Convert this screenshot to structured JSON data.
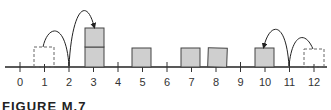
{
  "diagram": {
    "type": "number-line",
    "axis": {
      "min": 0,
      "max": 12,
      "tick_labels": [
        "0",
        "1",
        "2",
        "3",
        "4",
        "5",
        "6",
        "7",
        "8",
        "9",
        "10",
        "11",
        "12"
      ]
    },
    "solid_blocks": [
      {
        "position": 3,
        "stack": 2
      },
      {
        "position": 5,
        "stack": 1
      },
      {
        "position": 7,
        "stack": 1
      },
      {
        "position": 8,
        "stack": 1
      },
      {
        "position": 10,
        "stack": 1
      }
    ],
    "dashed_blocks": [
      {
        "position": 1
      },
      {
        "position": 12
      }
    ],
    "arrows": [
      {
        "from": 1,
        "via": 2,
        "to": 3,
        "description": "block hops from 1 over 2 onto stack at 3"
      },
      {
        "from": 12,
        "via": 11,
        "to": 10,
        "description": "block hops from 12 over 11 onto 10"
      }
    ],
    "colors": {
      "block_fill": "#cfcfcf",
      "stroke": "#333333"
    }
  },
  "caption": "FIGURE M.7"
}
